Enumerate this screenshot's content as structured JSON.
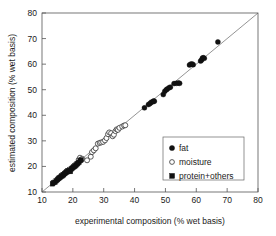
{
  "chart_data": {
    "type": "scatter",
    "title": "",
    "xlabel": "experimental composition (% wet basis)",
    "ylabel": "estimated composition (% wet basis)",
    "xlim": [
      10,
      80
    ],
    "ylim": [
      10,
      80
    ],
    "xticks": [
      10,
      20,
      30,
      40,
      50,
      60,
      70,
      80
    ],
    "yticks": [
      10,
      20,
      30,
      40,
      50,
      60,
      70,
      80
    ],
    "xtick_labels": [
      "10",
      "20",
      "30",
      "40",
      "50",
      "60",
      "70",
      "80"
    ],
    "ytick_labels": [
      "10",
      "20",
      "30",
      "40",
      "50",
      "60",
      "70",
      "80"
    ],
    "grid": false,
    "legend_position": "lower-right-inside",
    "reference_line": {
      "type": "identity",
      "from": [
        10,
        10
      ],
      "to": [
        80,
        80
      ]
    },
    "series": [
      {
        "name": "fat",
        "marker": "filled-circle",
        "color": "#111111",
        "points": [
          [
            43.2,
            42.9
          ],
          [
            44.5,
            44.2
          ],
          [
            45.0,
            44.6
          ],
          [
            45.4,
            45.1
          ],
          [
            45.9,
            45.3
          ],
          [
            46.2,
            45.6
          ],
          [
            46.4,
            45.5
          ],
          [
            49.3,
            48.1
          ],
          [
            49.8,
            49.4
          ],
          [
            50.3,
            50.0
          ],
          [
            50.6,
            50.3
          ],
          [
            51.2,
            50.8
          ],
          [
            51.6,
            51.0
          ],
          [
            52.8,
            52.4
          ],
          [
            53.6,
            52.5
          ],
          [
            54.2,
            52.6
          ],
          [
            54.6,
            52.5
          ],
          [
            57.8,
            59.7
          ],
          [
            58.2,
            60.0
          ],
          [
            58.6,
            60.1
          ],
          [
            59.0,
            59.8
          ],
          [
            61.4,
            61.2
          ],
          [
            61.7,
            61.6
          ],
          [
            62.0,
            62.4
          ],
          [
            62.3,
            62.5
          ],
          [
            62.6,
            62.3
          ],
          [
            67.0,
            68.7
          ]
        ]
      },
      {
        "name": "moisture",
        "marker": "open-circle",
        "color": "#333333",
        "points": [
          [
            21.9,
            22.6
          ],
          [
            22.3,
            23.4
          ],
          [
            23.0,
            23.0
          ],
          [
            24.6,
            22.4
          ],
          [
            25.8,
            23.8
          ],
          [
            26.2,
            25.6
          ],
          [
            26.8,
            26.3
          ],
          [
            27.4,
            27.1
          ],
          [
            28.1,
            28.9
          ],
          [
            28.7,
            29.2
          ],
          [
            29.2,
            29.4
          ],
          [
            29.8,
            29.6
          ],
          [
            30.4,
            30.2
          ],
          [
            30.9,
            31.1
          ],
          [
            31.4,
            32.6
          ],
          [
            31.8,
            33.3
          ],
          [
            32.4,
            33.0
          ],
          [
            32.9,
            31.8
          ],
          [
            33.3,
            32.4
          ],
          [
            33.8,
            33.8
          ],
          [
            34.2,
            34.5
          ],
          [
            34.6,
            34.3
          ],
          [
            35.1,
            35.1
          ],
          [
            36.0,
            35.6
          ],
          [
            36.6,
            36.0
          ],
          [
            37.0,
            36.1
          ]
        ]
      },
      {
        "name": "protein+others",
        "marker": "filled-square",
        "color": "#111111",
        "points": [
          [
            13.4,
            13.2
          ],
          [
            13.7,
            13.6
          ],
          [
            14.2,
            13.8
          ],
          [
            14.6,
            14.4
          ],
          [
            15.0,
            14.8
          ],
          [
            15.3,
            15.2
          ],
          [
            15.6,
            15.5
          ],
          [
            15.9,
            15.7
          ],
          [
            16.2,
            16.1
          ],
          [
            16.5,
            16.3
          ],
          [
            16.8,
            16.6
          ],
          [
            17.0,
            16.8
          ],
          [
            17.3,
            17.2
          ],
          [
            17.6,
            17.4
          ],
          [
            17.9,
            17.7
          ],
          [
            18.1,
            17.9
          ],
          [
            18.4,
            18.2
          ],
          [
            18.7,
            18.3
          ],
          [
            19.0,
            18.6
          ],
          [
            19.2,
            18.0
          ],
          [
            19.5,
            19.0
          ],
          [
            19.8,
            19.3
          ],
          [
            20.1,
            19.6
          ],
          [
            20.4,
            19.9
          ],
          [
            20.7,
            20.2
          ],
          [
            21.0,
            20.5
          ],
          [
            21.3,
            20.9
          ],
          [
            21.6,
            21.2
          ],
          [
            22.0,
            21.6
          ],
          [
            22.4,
            22.3
          ],
          [
            22.7,
            22.6
          ]
        ]
      }
    ]
  },
  "axes": {
    "x_title": "experimental composition (% wet basis)",
    "y_title": "estimated composition (% wet basis)"
  },
  "legend": {
    "items": [
      {
        "label": "fat",
        "marker": "filled-circle"
      },
      {
        "label": "moisture",
        "marker": "open-circle"
      },
      {
        "label": "protein+others",
        "marker": "filled-square"
      }
    ]
  }
}
